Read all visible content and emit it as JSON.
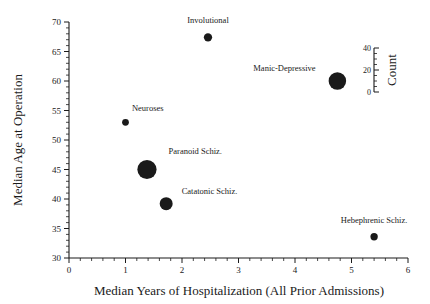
{
  "chart_data": {
    "type": "scatter",
    "title": "",
    "xlabel": "Median Years of Hospitalization (All Prior Admissions)",
    "ylabel": "Median Age at Operation",
    "xlim": [
      0,
      6
    ],
    "ylim": [
      30,
      70
    ],
    "xticks": [
      0,
      1,
      2,
      3,
      4,
      5,
      6
    ],
    "yticks": [
      30,
      35,
      40,
      45,
      50,
      55,
      60,
      65,
      70
    ],
    "xtick_labels": [
      "0",
      "1",
      "2",
      "3",
      "4",
      "5",
      "6"
    ],
    "ytick_labels": [
      "30",
      "35",
      "40",
      "45",
      "50",
      "55",
      "60",
      "65",
      "70"
    ],
    "x_minor_step": 0.2,
    "y_minor_step": 1,
    "grid": false,
    "size_legend": {
      "label": "Count",
      "ticks": [
        0,
        20,
        40
      ],
      "tick_labels": [
        "0",
        "20",
        "40"
      ],
      "minor_step": 5
    },
    "points": [
      {
        "label": "Involutional",
        "x": 2.46,
        "y": 67.4,
        "count": 9,
        "label_dx": 0,
        "label_dy": -10,
        "label_anchor": "middle"
      },
      {
        "label": "Manic-Depressive",
        "x": 4.75,
        "y": 60.0,
        "count": 40,
        "label_dx": -13,
        "label_dy": -1,
        "label_anchor": "end"
      },
      {
        "label": "Neuroses",
        "x": 1.0,
        "y": 53.0,
        "count": 6,
        "label_dx": 3,
        "label_dy": -8,
        "label_anchor": "start"
      },
      {
        "label": "Paranoid Schiz.",
        "x": 1.38,
        "y": 45.0,
        "count": 48,
        "label_dx": 12,
        "label_dy": -6,
        "label_anchor": "start"
      },
      {
        "label": "Catatonic Schiz.",
        "x": 1.72,
        "y": 39.2,
        "count": 22,
        "label_dx": 9,
        "label_dy": -3,
        "label_anchor": "start"
      },
      {
        "label": "Hebephrenic Schiz.",
        "x": 5.4,
        "y": 33.6,
        "count": 7,
        "label_dx": 0,
        "label_dy": -10,
        "label_anchor": "middle"
      }
    ]
  }
}
